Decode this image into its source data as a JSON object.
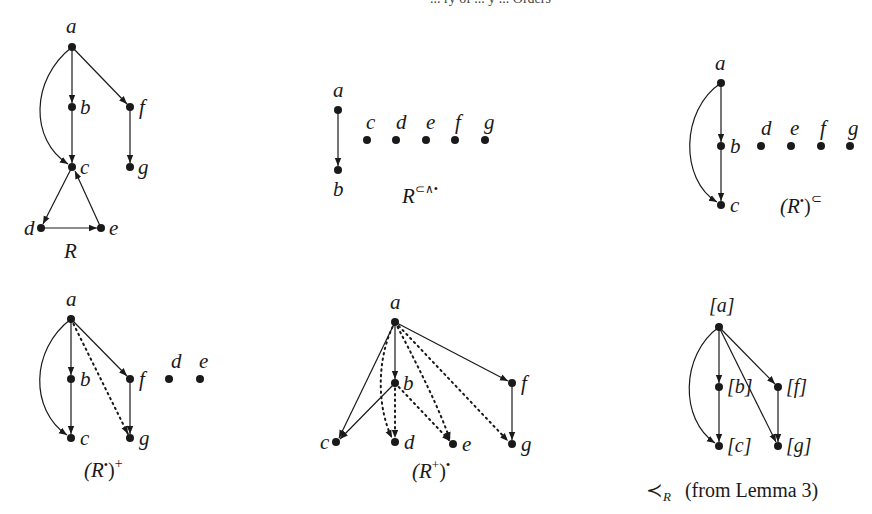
{
  "running_head": "... ry of ... y ... Orders",
  "panels": [
    {
      "id": "R",
      "caption": "R",
      "nodes": [
        {
          "label": "a",
          "x": 72,
          "y": 47
        },
        {
          "label": "b",
          "x": 72,
          "y": 107
        },
        {
          "label": "f",
          "x": 130,
          "y": 107
        },
        {
          "label": "c",
          "x": 72,
          "y": 167
        },
        {
          "label": "g",
          "x": 130,
          "y": 167
        },
        {
          "label": "d",
          "x": 41,
          "y": 228
        },
        {
          "label": "e",
          "x": 101,
          "y": 228
        }
      ],
      "edges": [
        {
          "from": "a",
          "to": "b",
          "style": "solid"
        },
        {
          "from": "b",
          "to": "c",
          "style": "solid"
        },
        {
          "from": "a",
          "to": "c",
          "style": "solid-curved"
        },
        {
          "from": "a",
          "to": "f",
          "style": "solid"
        },
        {
          "from": "f",
          "to": "g",
          "style": "solid"
        },
        {
          "from": "c",
          "to": "d",
          "style": "solid"
        },
        {
          "from": "d",
          "to": "e",
          "style": "solid"
        },
        {
          "from": "e",
          "to": "c",
          "style": "solid"
        }
      ]
    },
    {
      "id": "R-subset-wedge-bullet",
      "caption_base": "R",
      "caption_sup": "⊂∧•",
      "nodes": [
        {
          "label": "a",
          "x": 338,
          "y": 110
        },
        {
          "label": "b",
          "x": 338,
          "y": 170
        },
        {
          "label": "c",
          "x": 367,
          "y": 140
        },
        {
          "label": "d",
          "x": 396,
          "y": 140
        },
        {
          "label": "e",
          "x": 426,
          "y": 140
        },
        {
          "label": "f",
          "x": 455,
          "y": 140
        },
        {
          "label": "g",
          "x": 485,
          "y": 140
        }
      ],
      "edges": [
        {
          "from": "a",
          "to": "b",
          "style": "solid"
        }
      ]
    },
    {
      "id": "R-bullet-subset",
      "caption_pre": "(R",
      "caption_sup1": "•",
      "caption_post": ")",
      "caption_sup2": "⊂",
      "nodes": [
        {
          "label": "a",
          "x": 721,
          "y": 83
        },
        {
          "label": "b",
          "x": 721,
          "y": 146
        },
        {
          "label": "c",
          "x": 721,
          "y": 205
        },
        {
          "label": "d",
          "x": 761,
          "y": 146
        },
        {
          "label": "e",
          "x": 791,
          "y": 146
        },
        {
          "label": "f",
          "x": 821,
          "y": 146
        },
        {
          "label": "g",
          "x": 850,
          "y": 146
        }
      ],
      "edges": [
        {
          "from": "a",
          "to": "b",
          "style": "solid"
        },
        {
          "from": "b",
          "to": "c",
          "style": "solid"
        },
        {
          "from": "a",
          "to": "c",
          "style": "solid-curved"
        }
      ]
    },
    {
      "id": "R-bullet-plus",
      "caption_pre": "(R",
      "caption_sup1": "•",
      "caption_post": ")",
      "caption_sup2": "+",
      "nodes": [
        {
          "label": "a",
          "x": 71,
          "y": 319
        },
        {
          "label": "b",
          "x": 71,
          "y": 379
        },
        {
          "label": "c",
          "x": 71,
          "y": 438
        },
        {
          "label": "f",
          "x": 130,
          "y": 379
        },
        {
          "label": "g",
          "x": 130,
          "y": 438
        },
        {
          "label": "d",
          "x": 169,
          "y": 379
        },
        {
          "label": "e",
          "x": 200,
          "y": 379
        }
      ],
      "edges": [
        {
          "from": "a",
          "to": "b",
          "style": "solid"
        },
        {
          "from": "b",
          "to": "c",
          "style": "solid"
        },
        {
          "from": "a",
          "to": "c",
          "style": "solid-curved"
        },
        {
          "from": "a",
          "to": "f",
          "style": "solid"
        },
        {
          "from": "f",
          "to": "g",
          "style": "solid"
        },
        {
          "from": "a",
          "to": "g",
          "style": "dotted"
        }
      ]
    },
    {
      "id": "R-plus-bullet",
      "caption_pre": "(R",
      "caption_sup1": "+",
      "caption_post": ")",
      "caption_sup2": "•",
      "nodes": [
        {
          "label": "a",
          "x": 395,
          "y": 322
        },
        {
          "label": "b",
          "x": 395,
          "y": 383
        },
        {
          "label": "c",
          "x": 336,
          "y": 442
        },
        {
          "label": "d",
          "x": 395,
          "y": 442
        },
        {
          "label": "e",
          "x": 453,
          "y": 444
        },
        {
          "label": "f",
          "x": 512,
          "y": 383
        },
        {
          "label": "g",
          "x": 512,
          "y": 444
        }
      ],
      "edges": [
        {
          "from": "a",
          "to": "b",
          "style": "solid"
        },
        {
          "from": "a",
          "to": "c",
          "style": "solid"
        },
        {
          "from": "b",
          "to": "c",
          "style": "solid"
        },
        {
          "from": "a",
          "to": "f",
          "style": "solid"
        },
        {
          "from": "f",
          "to": "g",
          "style": "solid"
        },
        {
          "from": "a",
          "to": "d",
          "style": "dotted"
        },
        {
          "from": "b",
          "to": "d",
          "style": "dotted"
        },
        {
          "from": "b",
          "to": "e",
          "style": "dotted"
        },
        {
          "from": "a",
          "to": "e",
          "style": "dotted"
        },
        {
          "from": "a",
          "to": "g",
          "style": "dotted"
        }
      ]
    },
    {
      "id": "prec-R",
      "caption_symbol": "≺",
      "caption_sub": "R",
      "caption_note": "(from Lemma 3)",
      "nodes": [
        {
          "label": "[a]",
          "x": 719,
          "y": 327
        },
        {
          "label": "[b]",
          "x": 719,
          "y": 387
        },
        {
          "label": "[f]",
          "x": 778,
          "y": 387
        },
        {
          "label": "[c]",
          "x": 719,
          "y": 446
        },
        {
          "label": "[g]",
          "x": 778,
          "y": 446
        }
      ],
      "edges": [
        {
          "from": "[a]",
          "to": "[b]",
          "style": "solid"
        },
        {
          "from": "[b]",
          "to": "[c]",
          "style": "solid"
        },
        {
          "from": "[a]",
          "to": "[c]",
          "style": "solid-curved"
        },
        {
          "from": "[a]",
          "to": "[f]",
          "style": "solid"
        },
        {
          "from": "[f]",
          "to": "[g]",
          "style": "solid"
        },
        {
          "from": "[a]",
          "to": "[g]",
          "style": "solid"
        }
      ]
    }
  ]
}
